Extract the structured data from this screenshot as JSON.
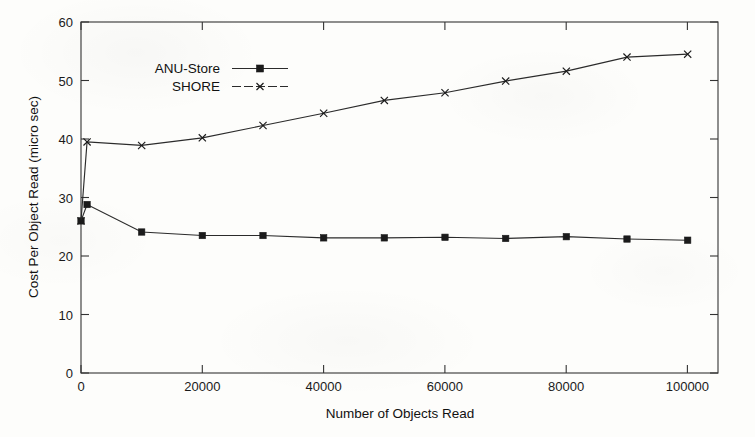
{
  "figure": {
    "background_color": "#fdfdfb",
    "ink_color": "#1b1b1b"
  },
  "chart_data": {
    "type": "line",
    "title": "",
    "xlabel": "Number of Objects Read",
    "ylabel": "Cost Per Object Read (micro sec)",
    "xlim": [
      0,
      105000
    ],
    "ylim": [
      0,
      60
    ],
    "grid": false,
    "legend_position": "top-left inside axes",
    "xticks": [
      0,
      20000,
      40000,
      60000,
      80000,
      100000
    ],
    "xtick_labels": [
      "0",
      "20000",
      "40000",
      "60000",
      "80000",
      "100000"
    ],
    "yticks": [
      0,
      10,
      20,
      30,
      40,
      50,
      60
    ],
    "ytick_labels": [
      "0",
      "10",
      "20",
      "30",
      "40",
      "50",
      "60"
    ],
    "series": [
      {
        "name": "ANU-Store",
        "marker": "filled-square",
        "x": [
          0,
          1000,
          10000,
          20000,
          30000,
          40000,
          50000,
          60000,
          70000,
          80000,
          90000,
          100000
        ],
        "values": [
          26.0,
          28.8,
          24.1,
          23.5,
          23.5,
          23.1,
          23.1,
          23.2,
          23.0,
          23.3,
          22.9,
          22.7
        ]
      },
      {
        "name": "SHORE",
        "marker": "cross",
        "x": [
          0,
          1000,
          10000,
          20000,
          30000,
          40000,
          50000,
          60000,
          70000,
          80000,
          90000,
          100000
        ],
        "values": [
          26.0,
          39.5,
          38.9,
          40.2,
          42.3,
          44.4,
          46.6,
          47.9,
          49.9,
          51.6,
          54.0,
          54.5
        ]
      }
    ]
  },
  "legend": {
    "entries": [
      {
        "label": "ANU-Store",
        "marker": "filled-square"
      },
      {
        "label": "SHORE",
        "marker": "cross"
      }
    ]
  }
}
